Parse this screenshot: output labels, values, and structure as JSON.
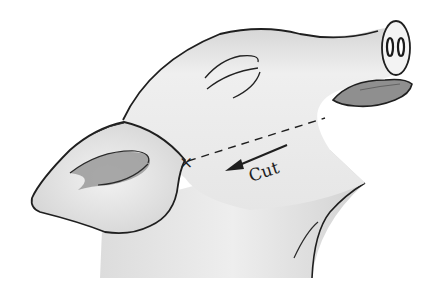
{
  "figure": {
    "annotations": {
      "cut_label": "Cut",
      "start_marker": "×"
    },
    "colors": {
      "skin": "#ededed",
      "skin_shadow": "#c9c9c9",
      "outline": "#1f1f1f",
      "tongue_and_ear_inner": "#8f8f8f",
      "background": "#ffffff"
    }
  }
}
